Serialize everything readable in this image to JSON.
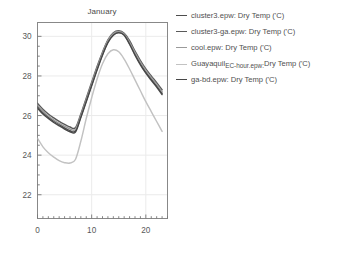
{
  "chart_data": {
    "type": "line",
    "title": "January",
    "xlabel": "",
    "ylabel": "",
    "xlim": [
      0,
      24
    ],
    "ylim": [
      20.8,
      30.7
    ],
    "xticks": [
      0,
      10,
      20
    ],
    "xtick_labels": [
      "0",
      "10",
      "20"
    ],
    "yticks": [
      22,
      24,
      26,
      28,
      30
    ],
    "ytick_labels": [
      "22",
      "24",
      "26",
      "28",
      "30"
    ],
    "x_minor_step": 1,
    "y_minor_step": 0.5,
    "grid": true,
    "legend_position": "right",
    "x": [
      0,
      1,
      2,
      3,
      4,
      5,
      6,
      7,
      8,
      9,
      10,
      11,
      12,
      13,
      14,
      15,
      16,
      17,
      18,
      19,
      20,
      21,
      22,
      23
    ],
    "series": [
      {
        "name": "cluster3.epw: Dry Temp ('C)",
        "color": "#4d4d4d",
        "values": [
          26.45,
          26.15,
          25.92,
          25.72,
          25.55,
          25.38,
          25.24,
          25.22,
          25.95,
          26.75,
          27.55,
          28.35,
          29.1,
          29.72,
          30.1,
          30.22,
          30.1,
          29.65,
          29.1,
          28.62,
          28.2,
          27.85,
          27.5,
          27.12
        ]
      },
      {
        "name": "cluster3-ga.epw: Dry Temp ('C)",
        "color": "#5a5a5a",
        "values": [
          26.62,
          26.32,
          26.08,
          25.88,
          25.7,
          25.55,
          25.42,
          25.38,
          26.08,
          26.88,
          27.68,
          28.48,
          29.2,
          29.82,
          30.18,
          30.28,
          30.16,
          29.78,
          29.25,
          28.78,
          28.36,
          28.0,
          27.66,
          27.3
        ]
      },
      {
        "name": "cool.epw: Dry Temp ('C)",
        "color": "#9a9a9a",
        "values": [
          26.52,
          26.22,
          25.98,
          25.78,
          25.6,
          25.46,
          25.32,
          25.3,
          26.0,
          26.8,
          27.6,
          28.4,
          29.15,
          29.78,
          30.14,
          30.25,
          30.12,
          29.7,
          29.18,
          28.7,
          28.28,
          27.92,
          27.58,
          27.2
        ]
      },
      {
        "name": "GuayaquilEC-hour.epw: Dry Temp ('C)",
        "color": "#c2c2c2",
        "values": [
          24.85,
          24.42,
          24.12,
          23.9,
          23.72,
          23.62,
          23.6,
          23.78,
          24.7,
          25.85,
          26.9,
          27.85,
          28.62,
          29.12,
          29.32,
          29.22,
          28.85,
          28.35,
          27.8,
          27.25,
          26.7,
          26.2,
          25.7,
          25.2
        ]
      },
      {
        "name": "ga-bd.epw: Dry Temp ('C)",
        "color": "#474747",
        "values": [
          26.38,
          26.08,
          25.85,
          25.65,
          25.48,
          25.32,
          25.18,
          25.16,
          25.9,
          26.7,
          27.5,
          28.3,
          29.05,
          29.68,
          30.06,
          30.18,
          30.06,
          29.6,
          29.05,
          28.56,
          28.14,
          27.78,
          27.44,
          27.06
        ]
      }
    ]
  },
  "legend": {
    "entries": [
      {
        "swatch_color": "#4d4d4d",
        "text": "cluster3.epw: Dry Temp ('C)",
        "head": "cluster3.epw: Dry Temp ('C)",
        "sub": "",
        "tail": ""
      },
      {
        "swatch_color": "#5a5a5a",
        "text": "cluster3-ga.epw: Dry Temp ('C)",
        "head": "cluster3-ga.epw: Dry Temp ('C)",
        "sub": "",
        "tail": ""
      },
      {
        "swatch_color": "#9a9a9a",
        "text": "cool.epw: Dry Temp ('C)",
        "head": "cool.epw: Dry Temp ('C)",
        "sub": "",
        "tail": ""
      },
      {
        "swatch_color": "#c2c2c2",
        "text": "GuayaquilEC-hour.epw: Dry Temp ('C)",
        "head": "Guayaquil",
        "sub": "EC-hour.epw:",
        "tail": "Dry Temp ('C)"
      },
      {
        "swatch_color": "#474747",
        "text": "ga-bd.epw: Dry Temp ('C)",
        "head": "ga-bd.epw: Dry Temp ('C)",
        "sub": "",
        "tail": ""
      }
    ]
  },
  "axes": {
    "frame_color": "#888888",
    "tick_color": "#777777",
    "grid_color": "#ebebeb",
    "label_color": "#595959"
  }
}
